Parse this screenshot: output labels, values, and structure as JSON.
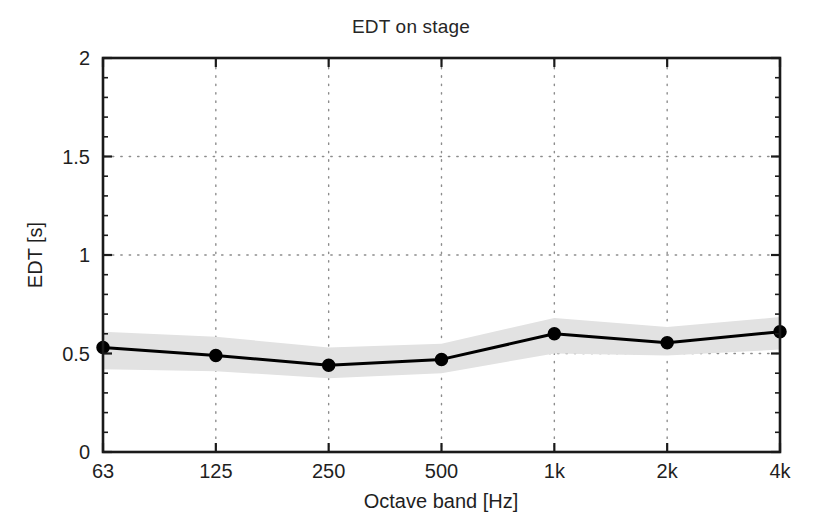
{
  "figure": {
    "width": 822,
    "height": 523,
    "background_color": "#ffffff"
  },
  "chart_data": {
    "type": "line",
    "title": "EDT on stage",
    "xlabel": "Octave band [Hz]",
    "ylabel": "EDT [s]",
    "categories": [
      "63",
      "125",
      "250",
      "500",
      "1k",
      "2k",
      "4k"
    ],
    "xtick_labels": [
      "63",
      "125",
      "250",
      "500",
      "1k",
      "2k",
      "4k"
    ],
    "ytick_labels": [
      "0",
      "0.5",
      "1",
      "1.5",
      "2"
    ],
    "ytick_values": [
      0,
      0.5,
      1,
      1.5,
      2
    ],
    "ylim": [
      0,
      2
    ],
    "grid": "dotted-both-axes",
    "legend": "none",
    "series": [
      {
        "name": "EDT mean",
        "values": [
          0.53,
          0.49,
          0.44,
          0.47,
          0.6,
          0.555,
          0.61
        ],
        "line_color": "#000000",
        "line_width": 3,
        "marker": "filled-circle",
        "marker_size": 12
      },
      {
        "name": "EDT spread upper",
        "values": [
          0.61,
          0.585,
          0.53,
          0.55,
          0.68,
          0.635,
          0.685
        ]
      },
      {
        "name": "EDT spread lower",
        "values": [
          0.42,
          0.41,
          0.375,
          0.4,
          0.5,
          0.49,
          0.52
        ]
      }
    ],
    "band": {
      "name": "standard deviation band",
      "fill_color": "#e2e2e2",
      "upper": [
        0.61,
        0.585,
        0.53,
        0.55,
        0.68,
        0.635,
        0.685
      ],
      "lower": [
        0.42,
        0.41,
        0.375,
        0.4,
        0.5,
        0.49,
        0.52
      ]
    },
    "colors": {
      "axis": "#1a1a1a",
      "grid": "#8c8c8c",
      "line": "#000000",
      "band": "#e2e2e2",
      "background": "#ffffff"
    },
    "plot_box": {
      "left": 103,
      "top": 58,
      "right": 780,
      "bottom": 452
    }
  }
}
